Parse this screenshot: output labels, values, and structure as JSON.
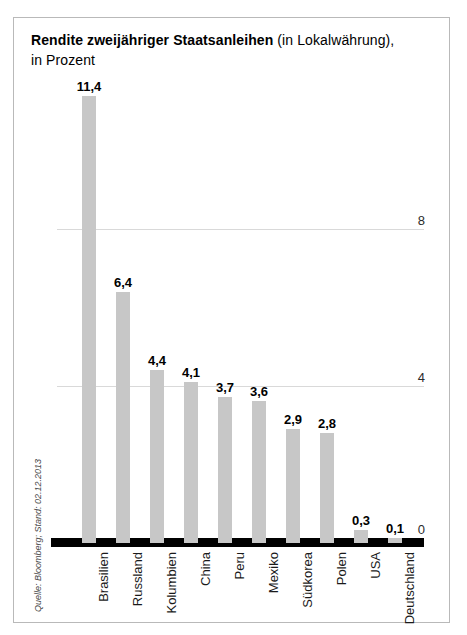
{
  "header": {
    "title_bold": "Rendite zweijähriger Staatsanleihen",
    "title_normal": " (in Lokalwährung),",
    "title_line2": "in Prozent"
  },
  "source_note": "Quelle: Bloomberg; Stand: 02.12.2013",
  "chart_data": {
    "type": "bar",
    "title": "Rendite zweijähriger Staatsanleihen (in Lokalwährung), in Prozent",
    "categories": [
      "Brasilien",
      "Russland",
      "Kolumbien",
      "China",
      "Peru",
      "Mexiko",
      "Südkorea",
      "Polen",
      "USA",
      "Deutschland"
    ],
    "values": [
      11.4,
      6.4,
      4.4,
      4.1,
      3.7,
      3.6,
      2.9,
      2.8,
      0.3,
      0.1
    ],
    "value_labels": [
      "11,4",
      "6,4",
      "4,4",
      "4,1",
      "3,7",
      "3,6",
      "2,9",
      "2,8",
      "0,3",
      "0,1"
    ],
    "xlabel": "",
    "ylabel": "",
    "ylim": [
      0,
      12
    ],
    "yticks": [
      8,
      4,
      0
    ],
    "ytick_labels": [
      "8",
      "4",
      "0"
    ],
    "grid": "horizontal-light",
    "legend": "none",
    "bar_color": "#c7c7c7",
    "baseline_color": "#000000",
    "source": "Quelle: Bloomberg; Stand: 02.12.2013"
  }
}
